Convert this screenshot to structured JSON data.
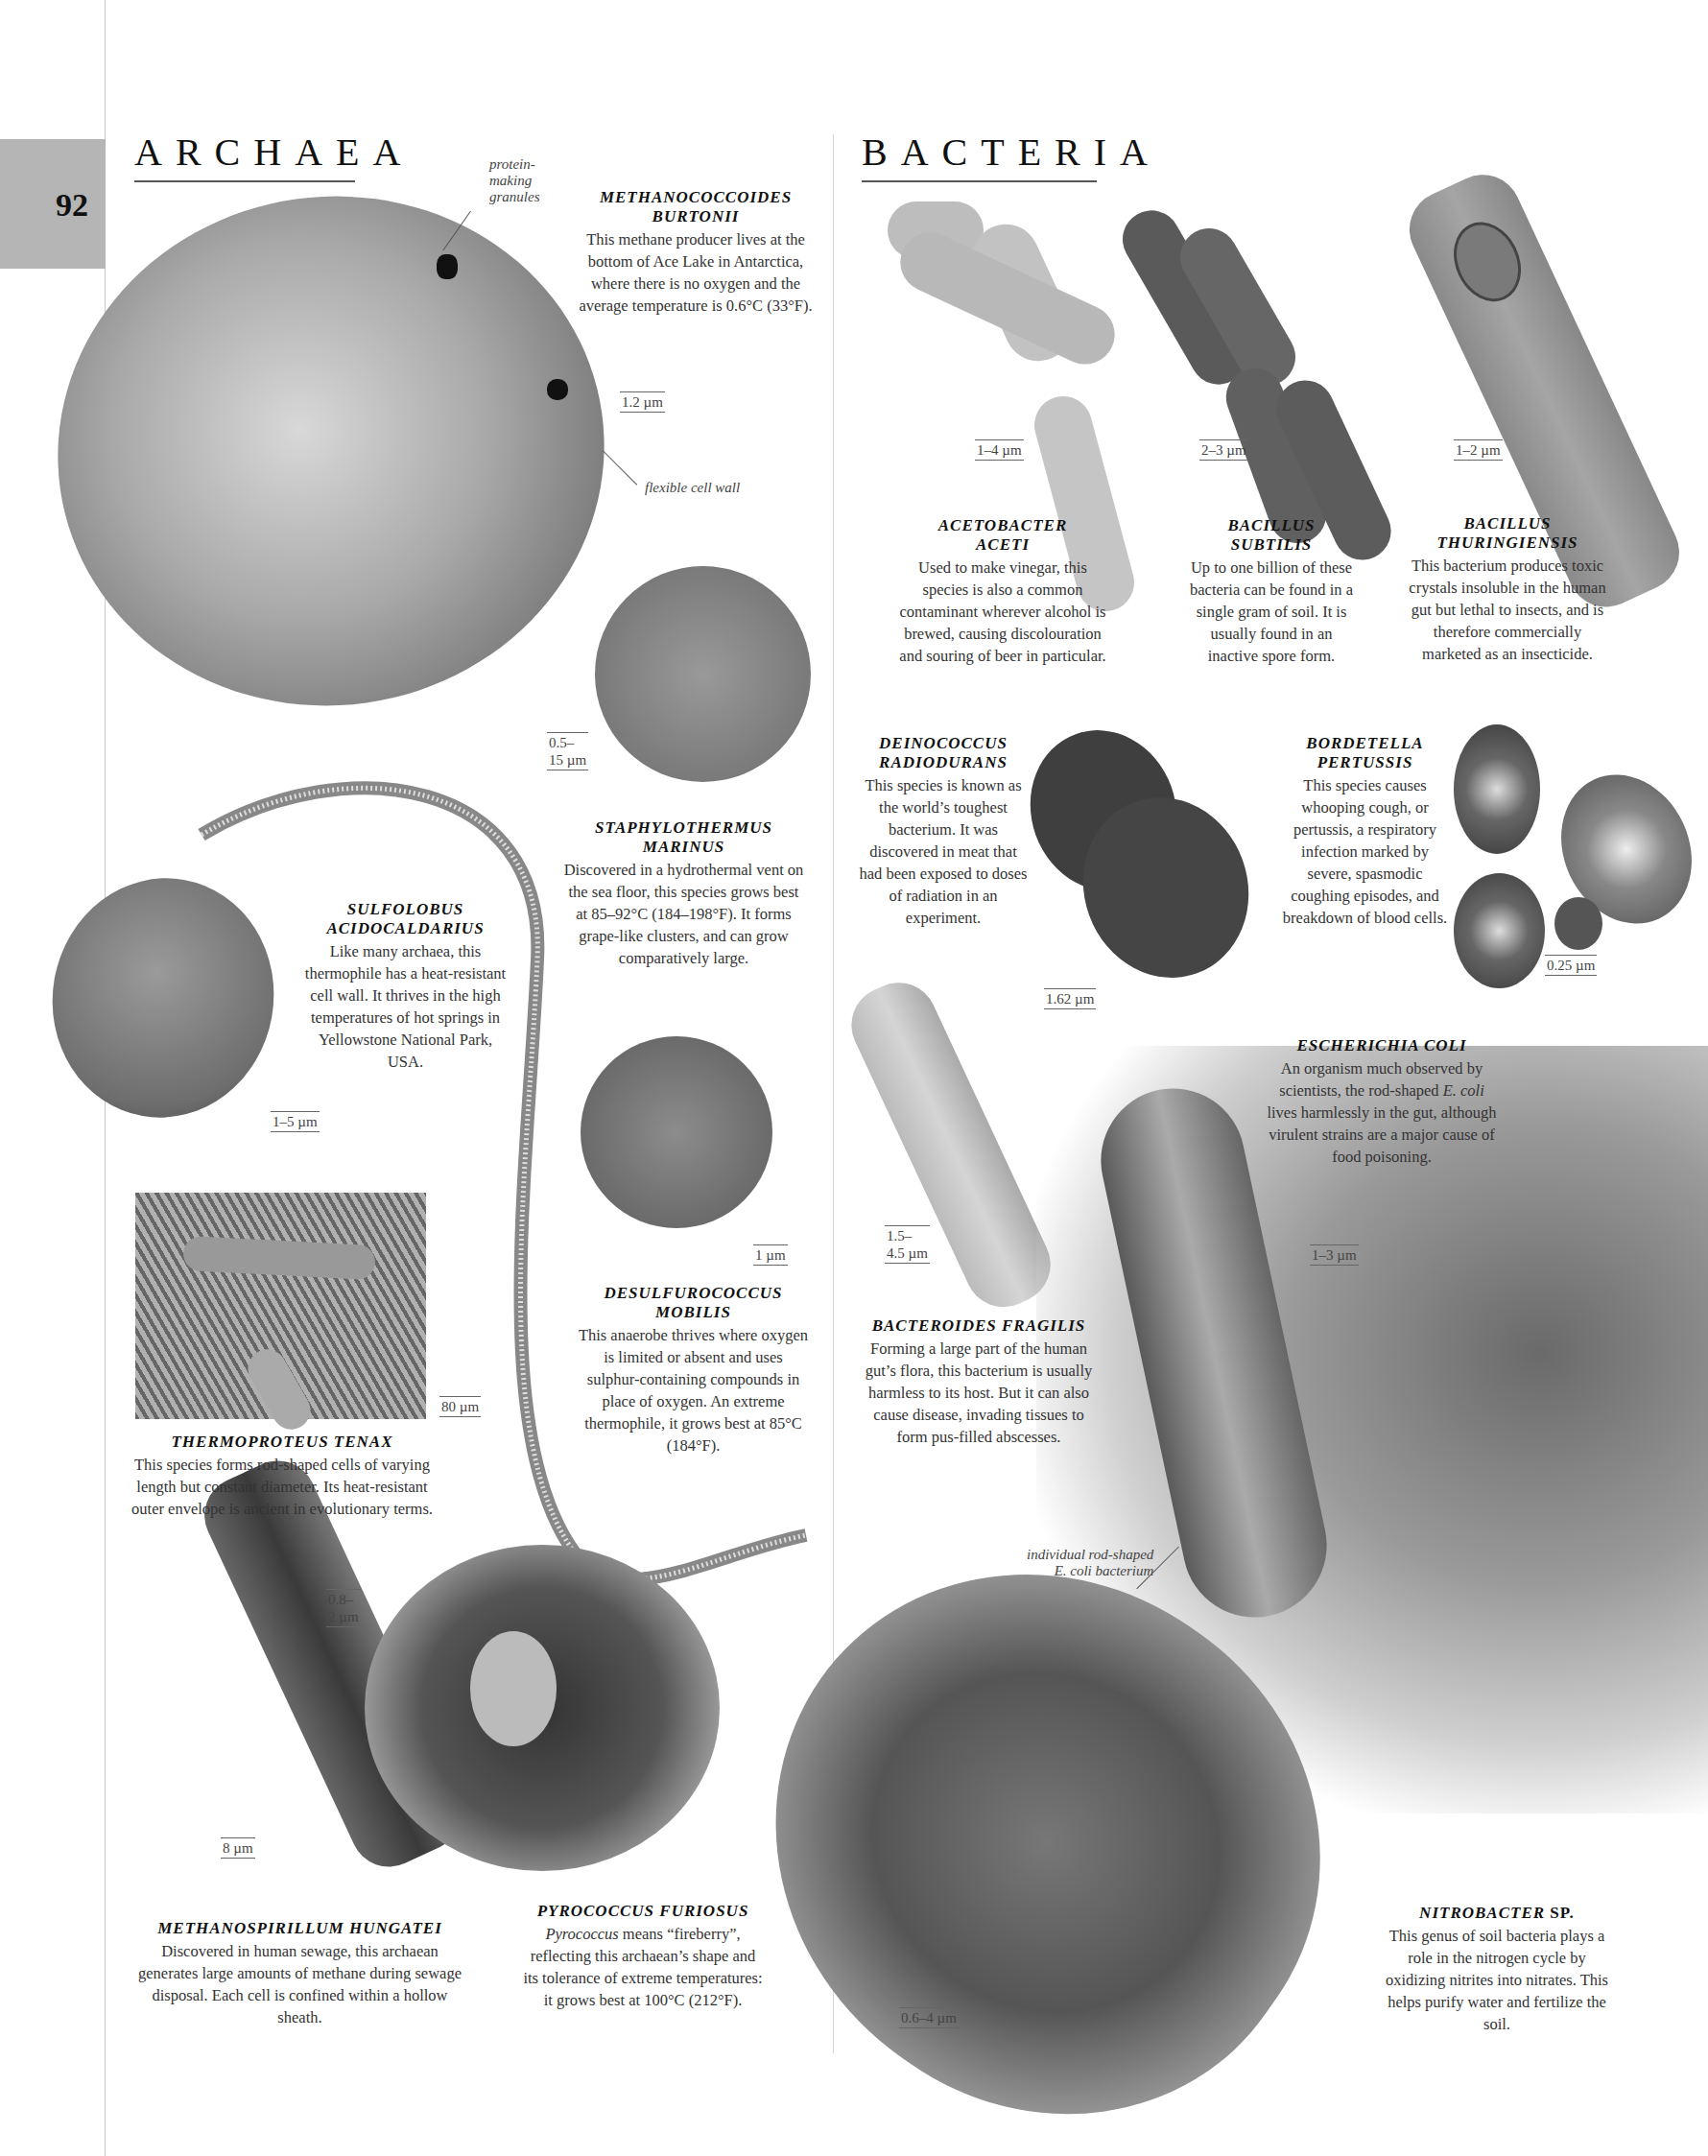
{
  "page": {
    "number": "92",
    "sections": {
      "archaea": "ARCHAEA",
      "bacteria": "BACTERIA"
    }
  },
  "annotations": {
    "protein_granules": "protein-\nmaking\ngranules",
    "flexible_wall": "flexible cell wall",
    "ecoli_individual": "individual rod-shaped\nE. coli bacterium"
  },
  "archaea": [
    {
      "name": "METHANOCOCCOIDES\nBURTONII",
      "description": "This methane producer lives at the bottom of Ace Lake in Antarctica, where there is no oxygen and the average temperature is 0.6°C (33°F).",
      "scale": "1.2 µm"
    },
    {
      "name": "STAPHYLOTHERMUS\nMARINUS",
      "description": "Discovered in a hydrothermal vent on the sea floor, this species grows best at 85–92°C (184–198°F). It forms grape-like clusters, and can grow comparatively large.",
      "scale": "0.5–\n15 µm"
    },
    {
      "name": "SULFOLOBUS\nACIDOCALDARIUS",
      "description": "Like many archaea, this thermophile has a heat-resistant cell wall. It thrives in the high temperatures of hot springs in Yellowstone National Park, USA.",
      "scale": "1–5 µm"
    },
    {
      "name": "DESULFUROCOCCUS\nMOBILIS",
      "description": "This anaerobe thrives where oxygen is limited or absent and uses sulphur-containing compounds in place of oxygen. An extreme thermophile, it grows best at 85°C (184°F).",
      "scale": "1 µm"
    },
    {
      "name": "THERMOPROTEUS TENAX",
      "description": "This species forms rod-shaped cells of varying length but constant diameter. Its heat-resistant outer envelope is ancient in evolutionary terms.",
      "scale": "80 µm"
    },
    {
      "name": "METHANOSPIRILLUM HUNGATEI",
      "description": "Discovered in human sewage, this archaean generates large amounts of methane during sewage disposal. Each cell is confined within a hollow sheath.",
      "scale": "8 µm"
    },
    {
      "name": "PYROCOCCUS FURIOSUS",
      "description_em": "Pyrococcus",
      "description": " means “fireberry”, reflecting this archaean’s shape and its tolerance of extreme temperatures: it grows best at 100°C (212°F).",
      "scale": "0.8–\n2 µm"
    }
  ],
  "bacteria": [
    {
      "name": "ACETOBACTER\nACETI",
      "description": "Used to make vinegar, this species is also a common contaminant wherever alcohol is brewed, causing discolouration and souring of beer in particular.",
      "scale": "1–4 µm"
    },
    {
      "name": "BACILLUS\nSUBTILIS",
      "description": "Up to one billion of these bacteria can be found in a single gram of soil. It is usually found in an inactive spore form.",
      "scale": "2–3 µm"
    },
    {
      "name": "BACILLUS\nTHURINGIENSIS",
      "description": "This bacterium produces toxic crystals insoluble in the human gut but lethal to insects, and is therefore commercially marketed as an insecticide.",
      "scale": "1–2 µm"
    },
    {
      "name": "DEINOCOCCUS\nRADIODURANS",
      "description": "This species is known as the world’s toughest bacterium. It was discovered in meat that had been exposed to doses of radiation in an experiment.",
      "scale": "1.62 µm"
    },
    {
      "name": "BORDETELLA\nPERTUSSIS",
      "description": "This species causes whooping cough, or pertussis, a respiratory infection marked by severe, spasmodic coughing episodes, and breakdown of blood cells.",
      "scale": "0.25 µm"
    },
    {
      "name": "ESCHERICHIA COLI",
      "description_em": "E. coli",
      "description_pre": "An organism much observed by scientists, the rod-shaped ",
      "description": " lives harmlessly in the gut, although virulent strains are a major cause of food poisoning.",
      "scale": "1–3 µm"
    },
    {
      "name": "BACTEROIDES FRAGILIS",
      "description": "Forming a large part of the human gut’s flora, this bacterium is usually harmless to its host. But it can also cause disease, invading tissues to form pus-filled abscesses.",
      "scale": "1.5–\n4.5 µm"
    },
    {
      "name_em": "NITROBACTER",
      "name": " SP.",
      "description": "This genus of soil bacteria plays a role in the nitrogen cycle by oxidizing nitrites into nitrates. This helps purify water and fertilize the soil.",
      "scale": "0.6–4 µm"
    }
  ],
  "colors": {
    "page_tab": "#b5b5b5",
    "rule": "#555555",
    "text": "#222222"
  }
}
